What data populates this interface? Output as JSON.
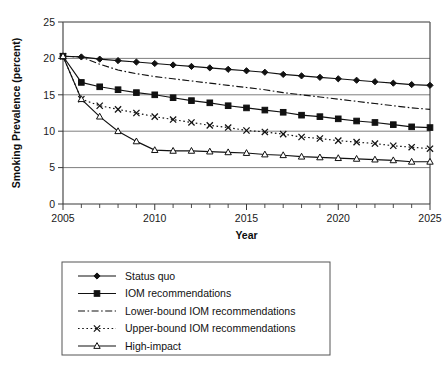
{
  "chart_data": {
    "type": "line",
    "title": "",
    "xlabel": "Year",
    "ylabel": "Smoking Prevalence (percent)",
    "xlim": [
      2005,
      2025
    ],
    "ylim": [
      0,
      25
    ],
    "ytick_step": 5,
    "xtick_step": 5,
    "xtick_minor_step": 1,
    "grid": "horizontal",
    "legend_position": "below-plot",
    "x": [
      2005,
      2006,
      2007,
      2008,
      2009,
      2010,
      2011,
      2012,
      2013,
      2014,
      2015,
      2016,
      2017,
      2018,
      2019,
      2020,
      2021,
      2022,
      2023,
      2024,
      2025
    ],
    "xticklabels": [
      "2005",
      "2010",
      "2015",
      "2020",
      "2025"
    ],
    "yticklabels": [
      "0",
      "5",
      "10",
      "15",
      "20",
      "25"
    ],
    "series": [
      {
        "name": "Status quo",
        "marker": "diamond",
        "linestyle": "solid",
        "values": [
          20.3,
          20.2,
          19.9,
          19.7,
          19.5,
          19.3,
          19.1,
          18.9,
          18.7,
          18.5,
          18.3,
          18.1,
          17.8,
          17.6,
          17.4,
          17.2,
          17.0,
          16.8,
          16.6,
          16.4,
          16.3
        ]
      },
      {
        "name": "IOM recommendations",
        "marker": "square",
        "linestyle": "solid",
        "values": [
          20.3,
          16.7,
          16.1,
          15.7,
          15.3,
          15.0,
          14.6,
          14.2,
          13.9,
          13.5,
          13.2,
          12.9,
          12.6,
          12.2,
          12.0,
          11.7,
          11.4,
          11.2,
          10.9,
          10.6,
          10.5
        ]
      },
      {
        "name": "Lower-bound IOM recommendations",
        "marker": "none",
        "linestyle": "dashdot",
        "values": [
          20.3,
          20.2,
          19.2,
          18.4,
          17.9,
          17.5,
          17.2,
          16.9,
          16.6,
          16.3,
          16.0,
          15.7,
          15.3,
          15.0,
          14.7,
          14.4,
          14.1,
          13.8,
          13.5,
          13.2,
          13.0
        ]
      },
      {
        "name": "Upper-bound IOM recommendations",
        "marker": "cross",
        "linestyle": "dotted",
        "values": [
          20.3,
          14.4,
          13.5,
          13.0,
          12.5,
          12.0,
          11.6,
          11.2,
          10.8,
          10.5,
          10.1,
          9.9,
          9.6,
          9.2,
          9.0,
          8.7,
          8.5,
          8.3,
          8.0,
          7.8,
          7.6
        ]
      },
      {
        "name": "High-impact",
        "marker": "triangle",
        "linestyle": "solid",
        "values": [
          20.3,
          14.4,
          12.0,
          10.0,
          8.6,
          7.4,
          7.3,
          7.3,
          7.2,
          7.1,
          7.0,
          6.8,
          6.7,
          6.5,
          6.4,
          6.3,
          6.2,
          6.1,
          6.0,
          5.8,
          5.8
        ]
      }
    ]
  }
}
